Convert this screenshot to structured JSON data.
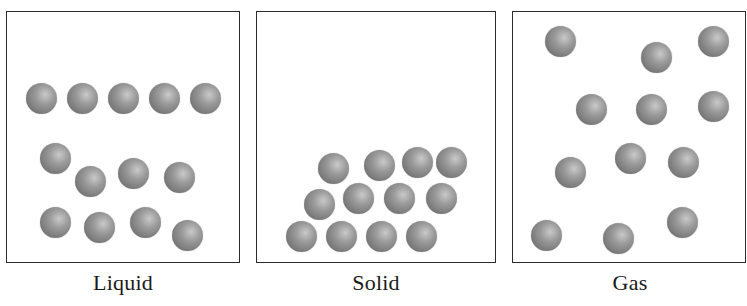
{
  "figure": {
    "panels": [
      {
        "id": "liquid",
        "label": "Liquid",
        "box": {
          "x": 6,
          "y": 11,
          "w": 234,
          "h": 252
        },
        "label_x": 123,
        "particles": [
          [
            41,
            98
          ],
          [
            82,
            98
          ],
          [
            123,
            98
          ],
          [
            164,
            98
          ],
          [
            205,
            98
          ],
          [
            55,
            158
          ],
          [
            90,
            181
          ],
          [
            133,
            173
          ],
          [
            179,
            177
          ],
          [
            55,
            222
          ],
          [
            99,
            227
          ],
          [
            145,
            222
          ],
          [
            187,
            235
          ]
        ]
      },
      {
        "id": "solid",
        "label": "Solid",
        "box": {
          "x": 256,
          "y": 11,
          "w": 240,
          "h": 252
        },
        "label_x": 376,
        "particles": [
          [
            333,
            168
          ],
          [
            379,
            165
          ],
          [
            417,
            162
          ],
          [
            451,
            162
          ],
          [
            319,
            204
          ],
          [
            358,
            198
          ],
          [
            399,
            198
          ],
          [
            441,
            198
          ],
          [
            301,
            236
          ],
          [
            341,
            236
          ],
          [
            381,
            236
          ],
          [
            421,
            236
          ]
        ]
      },
      {
        "id": "gas",
        "label": "Gas",
        "box": {
          "x": 512,
          "y": 11,
          "w": 234,
          "h": 252
        },
        "label_x": 630,
        "particles": [
          [
            560,
            41
          ],
          [
            656,
            57
          ],
          [
            713,
            41
          ],
          [
            591,
            109
          ],
          [
            651,
            109
          ],
          [
            713,
            106
          ],
          [
            570,
            172
          ],
          [
            630,
            158
          ],
          [
            683,
            162
          ],
          [
            546,
            235
          ],
          [
            618,
            238
          ],
          [
            682,
            222
          ]
        ]
      }
    ],
    "particle_style": {
      "diameter": 31,
      "highlight_color": "#c9c9c9",
      "mid_color": "#9a9a9a",
      "edge_color": "#5e5e5e"
    },
    "border_color": "#2b2b2b"
  }
}
